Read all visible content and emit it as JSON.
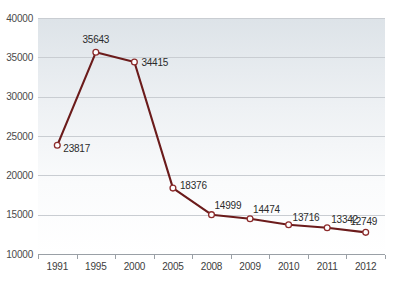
{
  "chart_data": {
    "type": "line",
    "title": "",
    "subtitle": "",
    "xlabel": "",
    "ylabel": "",
    "categories": [
      "1991",
      "1995",
      "2000",
      "2005",
      "2008",
      "2009",
      "2010",
      "2011",
      "2012"
    ],
    "values": [
      23817,
      35643,
      34415,
      18376,
      14999,
      14474,
      13716,
      13342,
      12749
    ],
    "data_labels": [
      "23817",
      "35643",
      "34415",
      "18376",
      "14999",
      "14474",
      "13716",
      "13342",
      "12749"
    ],
    "series": [
      {
        "name": "",
        "values": [
          23817,
          35643,
          34415,
          18376,
          14999,
          14474,
          13716,
          13342,
          12749
        ]
      }
    ],
    "ylim": [
      10000,
      40000
    ],
    "y_ticks": [
      10000,
      15000,
      20000,
      25000,
      30000,
      35000,
      40000
    ],
    "y_tick_labels": [
      "10000",
      "15000",
      "20000",
      "25000",
      "30000",
      "35000",
      "40000"
    ],
    "x_ticks": [
      "1991",
      "1995",
      "2000",
      "2005",
      "2008",
      "2009",
      "2010",
      "2011",
      "2012"
    ],
    "grid": true,
    "grid_axis": "y",
    "legend": false,
    "legend_position": "none",
    "annotations": [],
    "colors": {
      "line": "#6b1b1b",
      "marker_fill": "#ffffff",
      "marker_stroke": "#8c2b2b",
      "gridline": "#c9cdd2",
      "axis": "#9aa0a6",
      "tick_text": "#4a4a4a",
      "label_text": "#2b2b2b",
      "plot_background_top": "#dfe4e8",
      "plot_background_bottom": "#ffffff",
      "page_background": "#ffffff"
    }
  }
}
